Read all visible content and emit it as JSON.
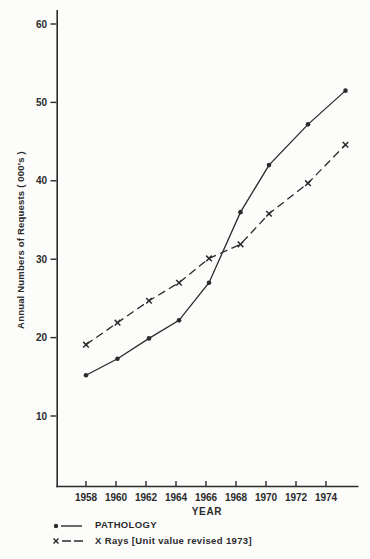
{
  "page": {
    "background": "#fcfcfb",
    "ink": "#2b2b2b"
  },
  "chart_data": {
    "type": "line",
    "title": "",
    "xlabel": "YEAR",
    "ylabel": "Annual Numbers of Requests ( 000's )",
    "x_ticks": [
      1958,
      1960,
      1962,
      1964,
      1966,
      1968,
      1970,
      1972,
      1974
    ],
    "y_ticks": [
      10,
      20,
      30,
      40,
      50,
      60
    ],
    "xlim": [
      1956,
      1976.2
    ],
    "ylim": [
      1,
      62
    ],
    "grid": false,
    "legend_position": "bottom-left",
    "x": [
      1958,
      1960.1,
      1962.2,
      1964.2,
      1966.2,
      1968.3,
      1970.2,
      1972.8,
      1975.3
    ],
    "series": [
      {
        "id": "pathology",
        "name": "PATHOLOGY",
        "marker": "dot",
        "line_style": "solid",
        "values": [
          15.2,
          17.3,
          19.9,
          22.2,
          27.0,
          36.0,
          42.0,
          47.2,
          51.5
        ]
      },
      {
        "id": "x-rays",
        "name": "X Rays [Unit value revised 1973]",
        "marker": "x",
        "line_style": "dashed",
        "values": [
          19.1,
          21.9,
          24.7,
          27.0,
          30.1,
          31.9,
          35.8,
          39.7,
          44.6
        ]
      }
    ]
  }
}
